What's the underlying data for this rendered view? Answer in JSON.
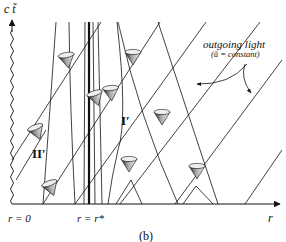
{
  "figure": {
    "panel_label": "(b)",
    "axes": {
      "vertical_label": "c t̃",
      "horizontal_label": "r"
    },
    "tick_labels": {
      "origin": "r = 0",
      "special_radius": "r = r*"
    },
    "regions": {
      "inner": "II′",
      "outer": "I′"
    },
    "annotation": {
      "title": "outgoing light",
      "subtitle": "(ũ = constant)"
    },
    "colors": {
      "ink": "#111111",
      "background": "#ffffff"
    }
  }
}
